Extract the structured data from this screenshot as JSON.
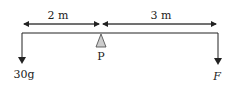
{
  "diagram": {
    "type": "lever / beam torque diagram",
    "dimensions": [
      {
        "label": "2 m",
        "from": "left end",
        "to": "pivot P"
      },
      {
        "label": "3 m",
        "from": "pivot P",
        "to": "right end"
      }
    ],
    "pivot": {
      "label": "P"
    },
    "forces": [
      {
        "label": "30g",
        "position": "left end",
        "direction": "down"
      },
      {
        "label": "F",
        "position": "right end",
        "direction": "down"
      }
    ],
    "colors": {
      "line": "#222222",
      "pivot_fill": "#cccccc"
    }
  }
}
